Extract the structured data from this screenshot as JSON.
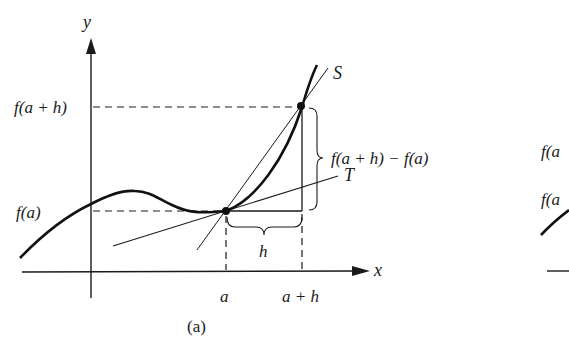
{
  "figure": {
    "caption": "(a)",
    "axes": {
      "x_label": "x",
      "y_label": "y"
    },
    "y_ticks": {
      "upper": "f(a + h)",
      "lower": "f(a)"
    },
    "x_ticks": {
      "left": "a",
      "right": "a + h"
    },
    "lines": {
      "secant": "S",
      "tangent": "T"
    },
    "braces": {
      "vertical": "f(a + h) − f(a)",
      "horizontal": "h"
    }
  },
  "partial_figure_right": {
    "labels": [
      "f(a",
      "f(a"
    ]
  },
  "colors": {
    "ink": "#1a1a1a",
    "background": "#ffffff"
  }
}
